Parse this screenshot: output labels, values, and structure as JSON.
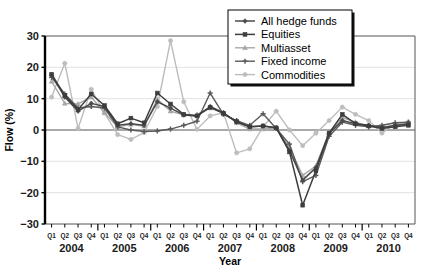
{
  "chart_data": {
    "type": "line",
    "title": "",
    "xlabel": "Year",
    "ylabel": "Flow (%)",
    "ylim": [
      -30,
      30
    ],
    "yticks": [
      30,
      20,
      10,
      0,
      -10,
      -20,
      -30
    ],
    "grid": true,
    "legend_position": "top-right",
    "x": [
      "Q1",
      "Q2",
      "Q3",
      "Q4",
      "Q1",
      "Q2",
      "Q3",
      "Q4",
      "Q1",
      "Q2",
      "Q3",
      "Q4",
      "Q1",
      "Q2",
      "Q3",
      "Q4",
      "Q1",
      "Q2",
      "Q3",
      "Q4",
      "Q1",
      "Q2",
      "Q3",
      "Q4",
      "Q1",
      "Q2",
      "Q3",
      "Q4"
    ],
    "year_groups": [
      {
        "label": "2004",
        "start": 0,
        "count": 4
      },
      {
        "label": "2005",
        "start": 4,
        "count": 4
      },
      {
        "label": "2006",
        "start": 8,
        "count": 4
      },
      {
        "label": "2007",
        "start": 12,
        "count": 4
      },
      {
        "label": "2008",
        "start": 16,
        "count": 4
      },
      {
        "label": "2009",
        "start": 20,
        "count": 4
      },
      {
        "label": "2010",
        "start": 24,
        "count": 4
      }
    ],
    "series": [
      {
        "name": "All hedge funds",
        "color": "#4a4a4a",
        "marker": "diamond",
        "width": 1.5,
        "values": [
          17.5,
          10.5,
          6.0,
          8.5,
          7.5,
          1.5,
          2.0,
          1.5,
          9.0,
          7.0,
          4.8,
          4.5,
          7.5,
          5.5,
          2.5,
          1.0,
          1.3,
          0.7,
          -6.5,
          -16.0,
          -12.0,
          -1.0,
          3.0,
          2.0,
          1.5,
          0.8,
          1.5,
          2.0
        ]
      },
      {
        "name": "Equities",
        "color": "#3d3d3d",
        "marker": "square",
        "width": 1.5,
        "values": [
          17.8,
          11.0,
          6.5,
          11.5,
          7.8,
          2.0,
          3.8,
          2.3,
          11.8,
          8.3,
          5.0,
          4.5,
          7.2,
          5.3,
          2.7,
          1.0,
          1.3,
          0.7,
          -7.0,
          -24.0,
          -13.0,
          -1.0,
          5.0,
          2.0,
          1.3,
          0.5,
          1.0,
          1.5
        ]
      },
      {
        "name": "Multiasset",
        "color": "#a8a8a8",
        "marker": "triangle",
        "width": 1.4,
        "values": [
          15.5,
          8.5,
          8.3,
          10.5,
          5.5,
          1.0,
          1.8,
          1.2,
          9.8,
          6.0,
          4.8,
          5.0,
          7.0,
          5.5,
          2.3,
          0.3,
          0.3,
          0.5,
          -5.5,
          -14.5,
          -11.5,
          -0.8,
          4.0,
          2.5,
          1.3,
          0.8,
          1.3,
          2.0
        ]
      },
      {
        "name": "Fixed income",
        "color": "#5a5a5a",
        "marker": "cross",
        "width": 1.4,
        "values": [
          16.8,
          11.5,
          7.0,
          7.5,
          7.0,
          1.0,
          0.0,
          -0.5,
          -0.3,
          0.3,
          1.5,
          2.8,
          11.8,
          5.0,
          3.0,
          1.5,
          5.2,
          0.5,
          -4.5,
          -16.5,
          -14.5,
          -2.0,
          2.5,
          1.5,
          1.0,
          1.5,
          2.3,
          2.5
        ]
      },
      {
        "name": "Commodities",
        "color": "#bdbdbd",
        "marker": "circle",
        "width": 1.4,
        "values": [
          10.5,
          21.3,
          0.5,
          13.0,
          5.5,
          -1.5,
          -3.0,
          -0.8,
          7.5,
          28.5,
          9.0,
          0.2,
          4.5,
          5.5,
          -7.3,
          -6.0,
          1.0,
          6.0,
          0.0,
          -5.0,
          -1.0,
          3.0,
          7.3,
          5.0,
          3.0,
          -1.0,
          2.0,
          2.5
        ]
      }
    ]
  },
  "legend": {
    "items": [
      {
        "label": "All hedge funds"
      },
      {
        "label": "Equities"
      },
      {
        "label": "Multiasset"
      },
      {
        "label": "Fixed income"
      },
      {
        "label": "Commodities"
      }
    ]
  }
}
